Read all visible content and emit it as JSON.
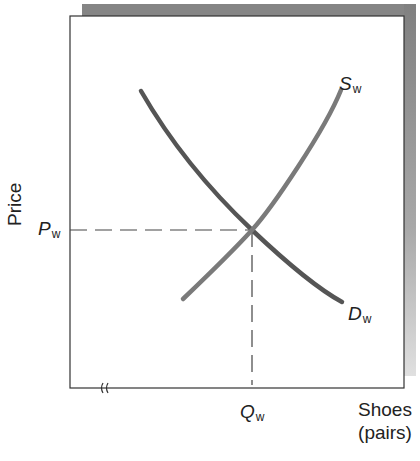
{
  "figure": {
    "y_axis_label": "Price",
    "x_axis_label_line1": "Shoes",
    "x_axis_label_line2": "(pairs)",
    "price_marker": {
      "symbol": "P",
      "subscript": "w"
    },
    "quantity_marker": {
      "symbol": "Q",
      "subscript": "w"
    },
    "supply_label": {
      "symbol": "S",
      "subscript": "w"
    },
    "demand_label": {
      "symbol": "D",
      "subscript": "w"
    },
    "axis_break_glyph": "≈"
  },
  "colors": {
    "demand_curve": "#555555",
    "supply_curve": "#7a7a7a",
    "axis": "#333333",
    "dashed_guides": "#444444",
    "frame_shadow": "#8a8a8a",
    "background": "#ffffff"
  },
  "curves": {
    "demand": {
      "name": "Demand (D_w)",
      "direction": "downward-sloping",
      "points": [
        [
          140,
          90
        ],
        [
          195,
          160
        ],
        [
          252,
          230
        ],
        [
          300,
          272
        ],
        [
          342,
          302
        ]
      ]
    },
    "supply": {
      "name": "Supply (S_w)",
      "direction": "upward-sloping",
      "points": [
        [
          182,
          300
        ],
        [
          220,
          262
        ],
        [
          252,
          230
        ],
        [
          300,
          165
        ],
        [
          341,
          90
        ]
      ]
    },
    "equilibrium": {
      "x": 252,
      "y": 230
    }
  }
}
